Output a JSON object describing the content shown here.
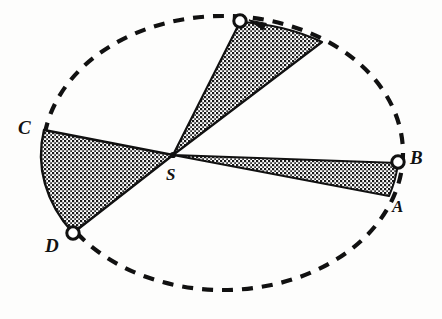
{
  "figure": {
    "background_color": "#fdfdfc",
    "stroke_color": "#111111",
    "hatch_color": "#1a1a1a",
    "orbit": {
      "shape": "ellipse",
      "style": "dashed",
      "center": {
        "x": 223,
        "y": 153
      },
      "radius_x": 180,
      "radius_y": 137,
      "dash_pattern": "11 9",
      "stroke_width": 4.2
    },
    "focus": {
      "name": "S",
      "label": "S",
      "x": 173,
      "y": 155,
      "label_x": 166,
      "label_y": 168
    },
    "markers": [
      {
        "name": "marker-top",
        "x": 240,
        "y": 21,
        "r": 6.2,
        "filled": false
      },
      {
        "name": "marker-b",
        "x": 398,
        "y": 162,
        "r": 6.2,
        "filled": false
      },
      {
        "name": "marker-d",
        "x": 73,
        "y": 233,
        "r": 6.2,
        "filled": false
      }
    ],
    "labels": [
      {
        "name": "label-a",
        "text": "A",
        "x": 392,
        "y": 198,
        "size": "md"
      },
      {
        "name": "label-b",
        "text": "B",
        "x": 410,
        "y": 148,
        "size": "lg"
      },
      {
        "name": "label-c",
        "text": "C",
        "x": 18,
        "y": 118,
        "size": "lg"
      },
      {
        "name": "label-d",
        "text": "D",
        "x": 45,
        "y": 236,
        "size": "lg"
      },
      {
        "name": "label-s",
        "text": "S",
        "x": 166,
        "y": 166,
        "size": "md"
      }
    ],
    "sectors": [
      {
        "name": "sector-ab",
        "description": "Shaded sector from focus S to arc A-B at perihelion side (right)",
        "apex": {
          "x": 173,
          "y": 155
        },
        "arc_start": {
          "x": 398,
          "y": 163
        },
        "arc_end": {
          "x": 389,
          "y": 196
        },
        "fill": "hatch"
      },
      {
        "name": "sector-cd",
        "description": "Shaded sector from focus S to arc C-D at aphelion side (left)",
        "apex": {
          "x": 173,
          "y": 155
        },
        "arc_start": {
          "x": 44,
          "y": 130
        },
        "arc_end": {
          "x": 73,
          "y": 233
        },
        "fill": "hatch"
      },
      {
        "name": "sector-top",
        "description": "Shaded sector from focus S to arc at upper right of orbit",
        "apex": {
          "x": 173,
          "y": 155
        },
        "arc_start": {
          "x": 240,
          "y": 22
        },
        "arc_end": {
          "x": 322,
          "y": 42
        },
        "fill": "hatch"
      }
    ],
    "direction_arrow": {
      "name": "orbit-direction-arrow",
      "points_toward": "marker-top",
      "tip": {
        "x": 249,
        "y": 20
      },
      "tail": {
        "x": 266,
        "y": 26
      }
    }
  }
}
